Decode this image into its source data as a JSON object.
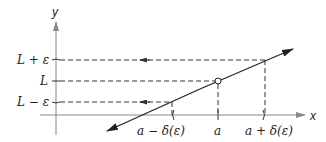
{
  "diagram": {
    "type": "epsilon-delta limit definition",
    "axes": {
      "x_label": "x",
      "y_label": "y"
    },
    "y_ticks": [
      {
        "label": "L + ε",
        "id": "L-plus-epsilon"
      },
      {
        "label": "L",
        "id": "L"
      },
      {
        "label": "L − ε",
        "id": "L-minus-epsilon"
      }
    ],
    "x_ticks": [
      {
        "label": "a − δ(ε)",
        "id": "a-minus-delta"
      },
      {
        "label": "a",
        "id": "a"
      },
      {
        "label": "a + δ(ε)",
        "id": "a-plus-delta"
      }
    ],
    "colors": {
      "axis": "#888888",
      "line": "#222222",
      "dashed": "#333333",
      "text": "#222222"
    }
  }
}
